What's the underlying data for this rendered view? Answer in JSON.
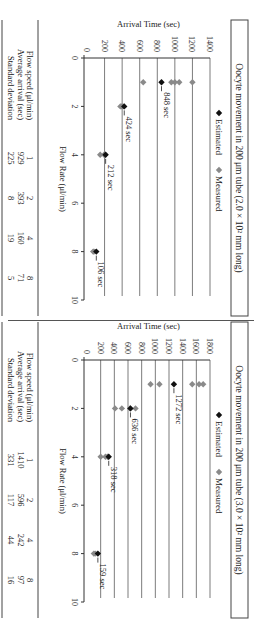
{
  "figure": {
    "orientation": "rotated 90 degrees clockwise",
    "legend": {
      "estimated_label": "Estimated",
      "measured_label": "Measured"
    },
    "colors": {
      "estimated": "#111111",
      "measured": "#8a8a8a",
      "gridline": "#444444",
      "axis": "#333333"
    }
  },
  "panels": [
    {
      "id": "panel-a",
      "title": "Oocyte movement in 200 μm tube (2.0 × 10² mm long)",
      "xlabel": "Flow Rate (μl/min)",
      "ylabel": "Arrival Time (sec)",
      "table": {
        "row_labels": [
          "Flow speed (μl/min)",
          "Average arrival (sec)",
          "Standard deviation"
        ],
        "columns": [
          {
            "flow": "1",
            "avg": "929",
            "sd": "225"
          },
          {
            "flow": "2",
            "avg": "393",
            "sd": "8"
          },
          {
            "flow": "4",
            "avg": "160",
            "sd": "19"
          },
          {
            "flow": "8",
            "avg": "71",
            "sd": "5"
          }
        ]
      }
    },
    {
      "id": "panel-b",
      "title": "Oocyte movement in 200 μm tube (3.0 × 10² mm long)",
      "xlabel": "Flow Rate (μl/min)",
      "ylabel": "Arrival Time (sec)",
      "table": {
        "row_labels": [
          "Flow speed (μl/min)",
          "Average arrival (sec)",
          "Standard deviation"
        ],
        "columns": [
          {
            "flow": "1",
            "avg": "1410",
            "sd": "331"
          },
          {
            "flow": "2",
            "avg": "596",
            "sd": "117"
          },
          {
            "flow": "4",
            "avg": "242",
            "sd": "44"
          },
          {
            "flow": "8",
            "avg": "97",
            "sd": "16"
          }
        ]
      }
    }
  ],
  "chart_data": [
    {
      "type": "scatter",
      "title": "Oocyte movement in 200 μm tube (2.0 × 10² mm long)",
      "xlabel": "Flow Rate (μl/min)",
      "ylabel": "Arrival Time (sec)",
      "xlim": [
        0,
        10
      ],
      "ylim": [
        0,
        1400
      ],
      "xticks": [
        0,
        2,
        4,
        6,
        8,
        10
      ],
      "yticks": [
        0,
        200,
        400,
        600,
        800,
        1000,
        1200,
        1400
      ],
      "grid": "horizontal",
      "legend_position": "top",
      "series": [
        {
          "name": "Estimated",
          "marker": "diamond-black",
          "points": [
            [
              1,
              848
            ],
            [
              2,
              424
            ],
            [
              4,
              212
            ],
            [
              8,
              106
            ]
          ]
        },
        {
          "name": "Measured",
          "marker": "diamond-gray",
          "points": [
            [
              1,
              1200
            ],
            [
              1,
              1050
            ],
            [
              1,
              1000
            ],
            [
              1,
              960
            ],
            [
              1,
              640
            ],
            [
              2,
              410
            ],
            [
              2,
              395
            ],
            [
              2,
              380
            ],
            [
              4,
              205
            ],
            [
              4,
              195
            ],
            [
              4,
              150
            ],
            [
              8,
              80
            ],
            [
              8,
              70
            ]
          ]
        }
      ],
      "annotations": [
        {
          "x": 1,
          "y": 848,
          "text": "848 sec"
        },
        {
          "x": 2,
          "y": 424,
          "text": "424 sec"
        },
        {
          "x": 4,
          "y": 212,
          "text": "212 sec"
        },
        {
          "x": 8,
          "y": 106,
          "text": "106 sec"
        }
      ],
      "table": {
        "flow_speed": [
          1,
          2,
          4,
          8
        ],
        "average_arrival_sec": [
          929,
          393,
          160,
          71
        ],
        "standard_deviation": [
          225,
          8,
          19,
          5
        ]
      }
    },
    {
      "type": "scatter",
      "title": "Oocyte movement in 200 μm tube (3.0 × 10² mm long)",
      "xlabel": "Flow Rate (μl/min)",
      "ylabel": "Arrival Time (sec)",
      "xlim": [
        0,
        10
      ],
      "ylim": [
        0,
        1800
      ],
      "xticks": [
        0,
        2,
        4,
        6,
        8,
        10
      ],
      "yticks": [
        0,
        200,
        400,
        600,
        800,
        1000,
        1200,
        1400,
        1600,
        1800
      ],
      "grid": "horizontal",
      "legend_position": "top",
      "series": [
        {
          "name": "Estimated",
          "marker": "diamond-black",
          "points": [
            [
              1,
              1272
            ],
            [
              2,
              636
            ],
            [
              4,
              318
            ],
            [
              8,
              159
            ]
          ]
        },
        {
          "name": "Measured",
          "marker": "diamond-gray",
          "points": [
            [
              1,
              1700
            ],
            [
              1,
              1640
            ],
            [
              1,
              1540
            ],
            [
              1,
              1060
            ],
            [
              1,
              930
            ],
            [
              2,
              710
            ],
            [
              2,
              630
            ],
            [
              2,
              510
            ],
            [
              2,
              410
            ],
            [
              4,
              300
            ],
            [
              4,
              270
            ],
            [
              4,
              200
            ],
            [
              8,
              120
            ],
            [
              8,
              100
            ]
          ]
        }
      ],
      "annotations": [
        {
          "x": 1,
          "y": 1272,
          "text": "1272 sec"
        },
        {
          "x": 2,
          "y": 636,
          "text": "636 sec"
        },
        {
          "x": 4,
          "y": 318,
          "text": "318 sec"
        },
        {
          "x": 8,
          "y": 159,
          "text": "159 sec"
        }
      ],
      "table": {
        "flow_speed": [
          1,
          2,
          4,
          8
        ],
        "average_arrival_sec": [
          1410,
          596,
          242,
          97
        ],
        "standard_deviation": [
          331,
          117,
          44,
          16
        ]
      }
    }
  ]
}
